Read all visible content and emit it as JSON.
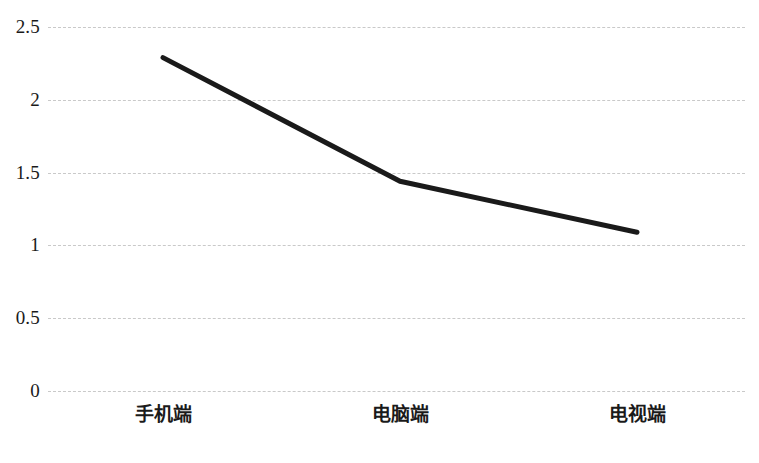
{
  "chart_data": {
    "type": "line",
    "title": "",
    "subtitle": "",
    "xlabel": "",
    "ylabel": "",
    "categories": [
      "手机端",
      "电脑端",
      "电视端"
    ],
    "series": [
      {
        "name": "",
        "values": [
          2.29,
          1.44,
          1.09
        ],
        "color": "#1a1a1a",
        "line_width": 5,
        "markers": false
      }
    ],
    "ylim": [
      0,
      2.5
    ],
    "yticks": [
      2.5,
      2,
      1.5,
      1,
      0.5,
      0
    ],
    "ytick_labels": [
      "2.5",
      "2",
      "1.5",
      "1",
      "0.5",
      "0"
    ],
    "grid": {
      "horizontal": true,
      "vertical": false,
      "style": "dashed",
      "color": "#c9c9c9"
    },
    "legend": {
      "visible": false,
      "position": "none"
    },
    "axis_lines": {
      "x_axis_visible": false,
      "y_axis_visible": false
    },
    "background_color": "#ffffff",
    "annotations": []
  },
  "layout": {
    "plot_left": 48,
    "plot_right": 745,
    "plot_top": 27,
    "plot_bottom": 391,
    "point_x_positions": [
      163,
      400,
      637
    ]
  }
}
